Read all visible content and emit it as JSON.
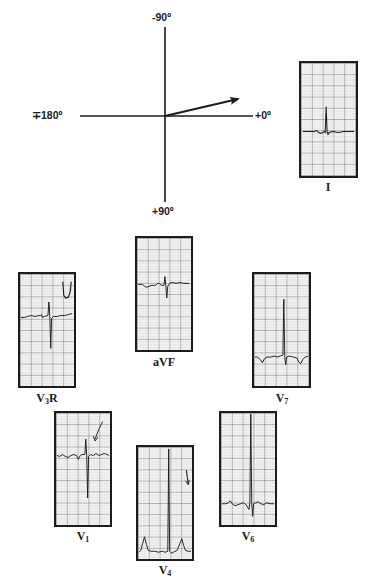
{
  "axis_diagram": {
    "labels": {
      "top": "-90º",
      "bottom": "+90º",
      "left": "∓180º",
      "right": "+0º"
    },
    "vector_angle_deg": -13,
    "line_color": "#1a1a1a"
  },
  "leads": [
    {
      "id": "I",
      "label_main": "I",
      "label_sub": "",
      "label_suffix": ""
    },
    {
      "id": "aVF",
      "label_main": "aVF",
      "label_sub": "",
      "label_suffix": ""
    },
    {
      "id": "V3R",
      "label_main": "V",
      "label_sub": "3",
      "label_suffix": "R"
    },
    {
      "id": "V7",
      "label_main": "V",
      "label_sub": "7",
      "label_suffix": ""
    },
    {
      "id": "V1",
      "label_main": "V",
      "label_sub": "1",
      "label_suffix": ""
    },
    {
      "id": "V4",
      "label_main": "V",
      "label_sub": "4",
      "label_suffix": ""
    },
    {
      "id": "V6",
      "label_main": "V",
      "label_sub": "6",
      "label_suffix": ""
    }
  ],
  "colors": {
    "grid_major": "#6e6e6e",
    "grid_minor": "#c9c9c9",
    "paper": "#f3f3f3",
    "trace": "#1a1a1a"
  }
}
